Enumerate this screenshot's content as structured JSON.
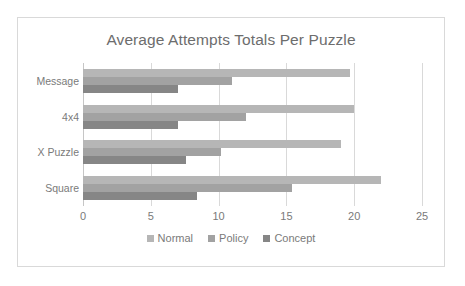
{
  "chart_data": {
    "type": "bar",
    "orientation": "horizontal",
    "title": "Average Attempts Totals Per Puzzle",
    "xlabel": "",
    "ylabel": "",
    "categories": [
      "Message",
      "4x4",
      "X Puzzle",
      "Square"
    ],
    "series": [
      {
        "name": "Normal",
        "color": "#b6b6b6",
        "values": [
          19.7,
          20.0,
          19.0,
          22.0
        ]
      },
      {
        "name": "Policy",
        "color": "#a2a2a2",
        "values": [
          11.0,
          12.0,
          10.2,
          15.4
        ]
      },
      {
        "name": "Concept",
        "color": "#868686",
        "values": [
          7.0,
          7.0,
          7.6,
          8.4
        ]
      }
    ],
    "xlim": [
      0,
      25
    ],
    "xticks": [
      "0",
      "5",
      "10",
      "15",
      "20",
      "25"
    ],
    "xtick_values": [
      0,
      5,
      10,
      15,
      20,
      25
    ],
    "grid": true,
    "legend_position": "bottom",
    "plot_background": "#ffffff",
    "grid_color": "#d9d9d9",
    "text_color": "#7a7a7a"
  }
}
